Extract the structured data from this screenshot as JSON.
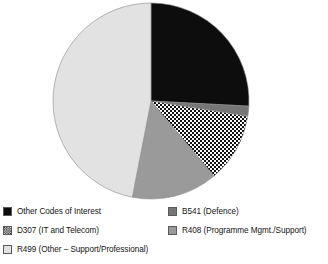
{
  "chart_data": {
    "type": "pie",
    "title": "",
    "subtitle": "",
    "xlabel": "",
    "ylabel": "",
    "grid": false,
    "legend_position": "bottom",
    "start_angle_deg": 0,
    "direction": "clockwise",
    "center": {
      "x": 151,
      "y": 101
    },
    "radius": 98,
    "categories": [
      "Other Codes of Interest",
      "B541 (Defence)",
      "D307 (IT and Telecom)",
      "R408 (Programme Mgmt./Support)",
      "R499 (Other – Support/Professional)"
    ],
    "values": [
      25.8,
      1.7,
      11.4,
      14.2,
      46.9
    ],
    "slices": [
      {
        "label": "Other Codes of Interest",
        "value": 25.8,
        "start_deg": 0,
        "end_deg": 93,
        "fill": "#0d0d0d",
        "pattern": "solid"
      },
      {
        "label": "B541 (Defence)",
        "value": 1.7,
        "start_deg": 93,
        "end_deg": 99,
        "fill": "#767676",
        "pattern": "solid"
      },
      {
        "label": "D307 (IT and Telecom)",
        "value": 11.4,
        "start_deg": 99,
        "end_deg": 140,
        "fill": "#ffffff",
        "pattern": "checker-dot"
      },
      {
        "label": "R408 (Programme Mgmt./Support)",
        "value": 14.2,
        "start_deg": 140,
        "end_deg": 191,
        "fill": "#9a9a9a",
        "pattern": "solid"
      },
      {
        "label": "R499 (Other – Support/Professional)",
        "value": 46.9,
        "start_deg": 191,
        "end_deg": 360,
        "fill": "#e2e2e2",
        "pattern": "solid"
      }
    ],
    "colors": {
      "other_codes_of_interest": "#0d0d0d",
      "b541_defence": "#767676",
      "d307_it_and_telecom": "#ffffff",
      "r408_programme_mgmt_support": "#9a9a9a",
      "r499_other_support_professional": "#e2e2e2",
      "outline": "#8a8a8a",
      "background": "#ffffff",
      "text": "#141414"
    }
  },
  "legend": {
    "columns": [
      {
        "items": [
          {
            "label": "Other Codes of Interest",
            "swatch": "swatch-solid-black",
            "fill": "#0d0d0d",
            "pattern": "solid"
          },
          {
            "label": "D307 (IT and Telecom)",
            "swatch": "swatch-checker-dot",
            "fill": "#ffffff",
            "pattern": "checker-dot"
          },
          {
            "label": "R499 (Other – Support/Professional)",
            "swatch": "swatch-solid-light-gray",
            "fill": "#e2e2e2",
            "pattern": "solid"
          }
        ]
      },
      {
        "items": [
          {
            "label": "B541 (Defence)",
            "swatch": "swatch-solid-dark-gray",
            "fill": "#767676",
            "pattern": "solid"
          },
          {
            "label": "R408 (Programme Mgmt./Support)",
            "swatch": "swatch-solid-medium-gray",
            "fill": "#9a9a9a",
            "pattern": "solid"
          }
        ]
      }
    ]
  }
}
